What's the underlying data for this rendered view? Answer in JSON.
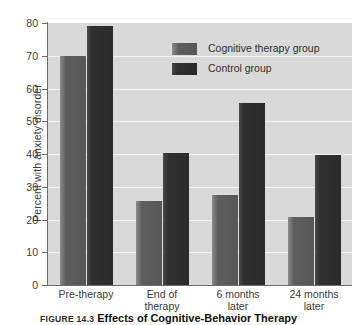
{
  "chart_data": {
    "type": "bar",
    "title": "",
    "xlabel": "",
    "ylabel": "Percent with anxiety disorder",
    "ylim": [
      0,
      80
    ],
    "yticks": [
      0,
      10,
      20,
      30,
      40,
      50,
      60,
      70,
      80
    ],
    "ytick_labels": [
      "0",
      "10",
      "20",
      "30",
      "40",
      "50",
      "60",
      "70",
      "80"
    ],
    "grid": true,
    "legend_position": "upper right inside plot",
    "categories": [
      "Pre-therapy",
      "End of therapy",
      "6 months later",
      "24 months later"
    ],
    "category_lines": [
      [
        "Pre-therapy"
      ],
      [
        "End of",
        "therapy"
      ],
      [
        "6 months",
        "later"
      ],
      [
        "24 months",
        "later"
      ]
    ],
    "series": [
      {
        "name": "Cognitive therapy group",
        "color": "#5e5e5e",
        "values": [
          70.0,
          25.7,
          27.5,
          20.7
        ]
      },
      {
        "name": "Control group",
        "color": "#2f2f2f",
        "values": [
          79.0,
          40.2,
          55.5,
          39.8
        ]
      }
    ]
  },
  "figure": {
    "caption_number": "FIGURE 14.3",
    "caption_title": "Effects of Cognitive-Behavior Therapy",
    "plot_background": "#d9d9d9",
    "gridline_color": "#f4f4f4",
    "axis_color": "#6d6d6d"
  }
}
